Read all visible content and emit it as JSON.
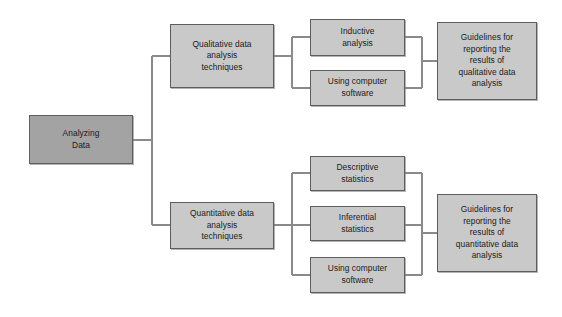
{
  "diagram": {
    "colors": {
      "root_fill": "#a3a3a3",
      "node_fill": "#c9c9c9",
      "border": "#5d5d5d",
      "connector": "#8a8a8a",
      "text": "#1a1a1a",
      "background": "#ffffff"
    },
    "nodes": [
      {
        "id": "analyzing-data",
        "label": "Analyzing\nData",
        "level": 0,
        "style": "root",
        "x": 29,
        "y": 115,
        "w": 104,
        "h": 49
      },
      {
        "id": "qualitative-techniques",
        "label": "Qualitative data\nanalysis\ntechniques",
        "level": 1,
        "style": "node",
        "x": 170,
        "y": 24,
        "w": 104,
        "h": 64
      },
      {
        "id": "quantitative-techniques",
        "label": "Quantitative data\nanalysis\ntechniques",
        "level": 1,
        "style": "node",
        "x": 170,
        "y": 202,
        "w": 104,
        "h": 47
      },
      {
        "id": "inductive-analysis",
        "label": "Inductive\nanalysis",
        "level": 2,
        "style": "node",
        "x": 310,
        "y": 19,
        "w": 95,
        "h": 37
      },
      {
        "id": "qual-using-computer-software",
        "label": "Using computer\nsoftware",
        "level": 2,
        "style": "node",
        "x": 310,
        "y": 70,
        "w": 95,
        "h": 36
      },
      {
        "id": "descriptive-statistics",
        "label": "Descriptive\nstatistics",
        "level": 2,
        "style": "node",
        "x": 310,
        "y": 156,
        "w": 95,
        "h": 35
      },
      {
        "id": "inferential-statistics",
        "label": "Inferential\nstatistics",
        "level": 2,
        "style": "node",
        "x": 310,
        "y": 206,
        "w": 95,
        "h": 35
      },
      {
        "id": "quant-using-computer-software",
        "label": "Using computer\nsoftware",
        "level": 2,
        "style": "node",
        "x": 310,
        "y": 257,
        "w": 95,
        "h": 36
      },
      {
        "id": "qualitative-guidelines",
        "label": "Guidelines for\nreporting the\nresults of\nqualitative data\nanalysis",
        "level": 3,
        "style": "node",
        "x": 437,
        "y": 22,
        "w": 100,
        "h": 78
      },
      {
        "id": "quantitative-guidelines",
        "label": "Guidelines for\nreporting the\nresults of\nquantitative data\nanalysis",
        "level": 3,
        "style": "node",
        "x": 437,
        "y": 194,
        "w": 100,
        "h": 78
      }
    ],
    "connectors": [
      {
        "id": "root-trunk",
        "from": "analyzing-data",
        "to": "level-1-bus",
        "path": "M133,140 L152,140 M152,56 L152,225 M152,56 L170,56 M152,225 L170,225"
      },
      {
        "id": "qual-branch",
        "from": "qualitative-techniques",
        "to": "qual-children",
        "path": "M274,56 L292,56 M292,37 L292,88 M292,37 L310,37 M292,88 L310,88"
      },
      {
        "id": "qual-merge",
        "from": "qual-children",
        "to": "qualitative-guidelines",
        "path": "M405,37 L422,37 M405,88 L422,88 M422,37 L422,88 M422,61 L437,61"
      },
      {
        "id": "quant-branch",
        "from": "quantitative-techniques",
        "to": "quant-children",
        "path": "M274,225 L292,225 M292,173 L292,275 M292,173 L310,173 M292,225 L310,225 M292,275 L310,275"
      },
      {
        "id": "quant-merge",
        "from": "quant-children",
        "to": "quantitative-guidelines",
        "path": "M405,173 L422,173 M405,225 L422,225 M405,275 L422,275 M422,173 L422,275 M422,233 L437,233"
      }
    ]
  }
}
